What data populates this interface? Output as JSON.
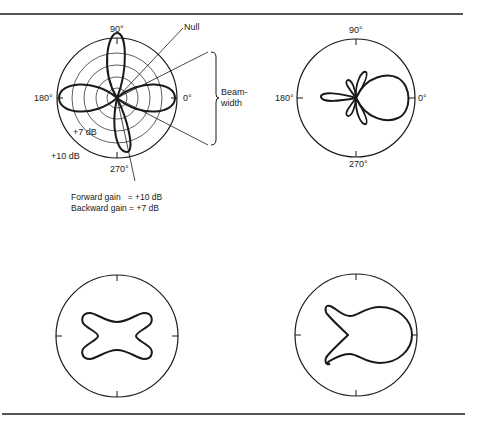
{
  "figure": {
    "panels": [
      {
        "id": "top-left",
        "labels": {
          "deg90": "90°",
          "deg0": "0°",
          "deg180": "180°",
          "deg270": "270°",
          "inner_ring": "+7 dB",
          "outer_ring": "+10 dB"
        },
        "annotations": {
          "null": "Null",
          "beamwidth_line1": "Beam-",
          "beamwidth_line2": "width"
        },
        "caption": {
          "forward": "Forward gain   = +10 dB",
          "backward": "Backward gain = +7 dB"
        }
      },
      {
        "id": "top-right",
        "labels": {
          "deg90": "90°",
          "deg0": "0°",
          "deg180": "180°",
          "deg270": "270°"
        }
      },
      {
        "id": "bottom-left"
      },
      {
        "id": "bottom-right"
      }
    ],
    "colors": {
      "ink": "#1a1a1a",
      "rule": "#555555",
      "background": "#ffffff"
    }
  }
}
